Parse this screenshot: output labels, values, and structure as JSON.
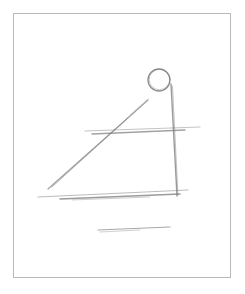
{
  "figure": {
    "description": "Pencil sketch of a right-triangle-like construction: a small circle at top right, a vertical line descending from it, a diagonal line on the left, two horizontal lines, and a short underline below",
    "stroke_color": "#7a7a7a",
    "frame_color": "#b8b8b8",
    "background": "#ffffff",
    "shapes": {
      "circle": {
        "cx": 159,
        "cy": 80,
        "r": 11
      },
      "vertical_line": {
        "x1": 171,
        "y1": 84,
        "x2": 177,
        "y2": 196
      },
      "diagonal_line": {
        "x1": 48,
        "y1": 189,
        "x2": 148,
        "y2": 100
      },
      "upper_horizontal": {
        "x1": 85,
        "y1": 132,
        "x2": 200,
        "y2": 128
      },
      "base_horizontal": {
        "x1": 38,
        "y1": 197,
        "x2": 188,
        "y2": 191
      },
      "underline": {
        "x1": 98,
        "y1": 231,
        "x2": 170,
        "y2": 228
      }
    }
  }
}
